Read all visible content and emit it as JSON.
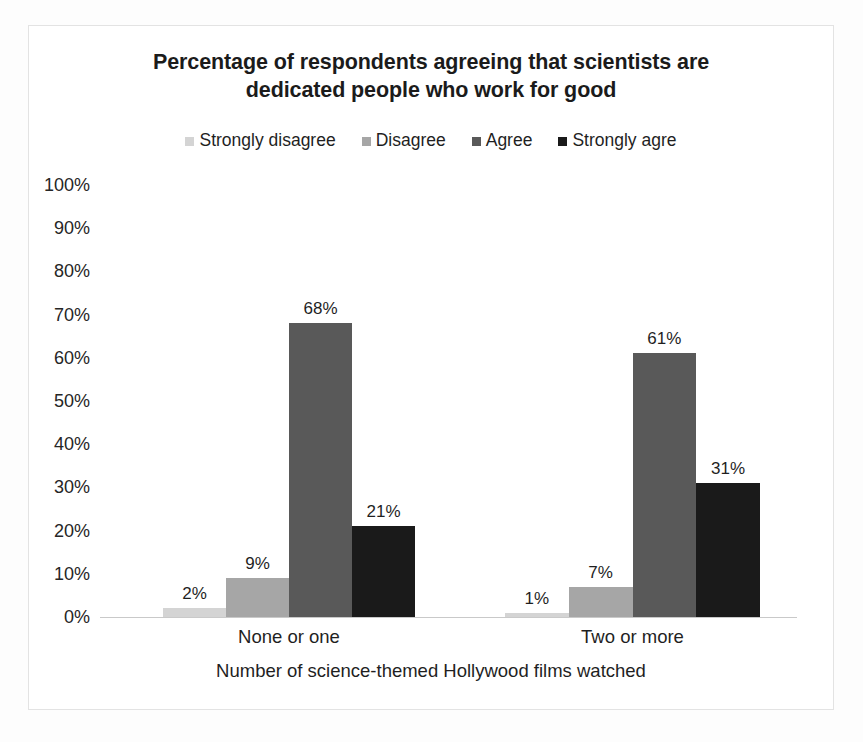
{
  "chart_data": {
    "type": "bar",
    "title": "Percentage of respondents agreeing that scientists are dedicated people who work for good",
    "title_lines": [
      "Percentage of respondents agreeing that scientists are",
      "dedicated people who work for good"
    ],
    "xlabel": "Number of science-themed Hollywood films watched",
    "ylabel": "",
    "categories": [
      "None or one",
      "Two or more"
    ],
    "ylim": [
      0,
      100
    ],
    "y_ticks": [
      "0%",
      "10%",
      "20%",
      "30%",
      "40%",
      "50%",
      "60%",
      "70%",
      "80%",
      "90%",
      "100%"
    ],
    "y_tick_values": [
      0,
      10,
      20,
      30,
      40,
      50,
      60,
      70,
      80,
      90,
      100
    ],
    "grid": false,
    "legend_position": "top-center",
    "value_label_suffix": "%",
    "series": [
      {
        "name": "Strongly disagree",
        "color": "#d4d4d4",
        "values": [
          2,
          1
        ],
        "labels": [
          "2%",
          "1%"
        ]
      },
      {
        "name": "Disagree",
        "color": "#a6a6a6",
        "values": [
          9,
          7
        ],
        "labels": [
          "9%",
          "7%"
        ]
      },
      {
        "name": "Agree",
        "color": "#595959",
        "values": [
          68,
          61
        ],
        "labels": [
          "68%",
          "61%"
        ]
      },
      {
        "name": "Strongly agre",
        "color": "#1a1a1a",
        "values": [
          21,
          31
        ],
        "labels": [
          "21%",
          "31%"
        ]
      }
    ]
  }
}
